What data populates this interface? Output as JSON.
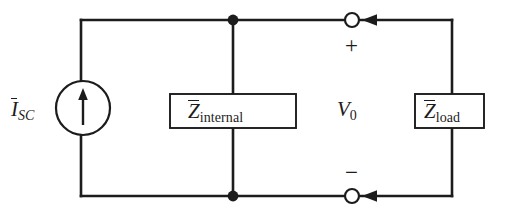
{
  "diagram": {
    "type": "electrical-schematic",
    "background_color": "#ffffff",
    "line_color": "#1c1c1c",
    "text_color": "#1c1c1c",
    "labels": {
      "current_source": {
        "symbol": "I",
        "subscript": "SC",
        "overbar": true,
        "full_text": "I̅SC"
      },
      "internal_impedance": {
        "symbol": "Z",
        "subscript": "internal",
        "overbar": true,
        "full_text": "Z̅internal"
      },
      "load_impedance": {
        "symbol": "Z",
        "subscript": "load",
        "overbar": true,
        "full_text": "Z̅load"
      },
      "output_voltage": {
        "symbol": "V",
        "subscript": "0",
        "overbar": false,
        "full_text": "V0"
      },
      "polarity_positive": "+",
      "polarity_negative": "−"
    },
    "components": [
      {
        "name": "current-source",
        "kind": "circle-with-up-arrow",
        "label": "I̅SC"
      },
      {
        "name": "internal-impedance-box",
        "kind": "rectangle",
        "label": "Z̅internal"
      },
      {
        "name": "load-impedance-box",
        "kind": "rectangle",
        "label": "Z̅load"
      },
      {
        "name": "output-terminal-top",
        "kind": "open-circle"
      },
      {
        "name": "output-terminal-bottom",
        "kind": "open-circle"
      },
      {
        "name": "junction-dot-top",
        "kind": "filled-dot"
      },
      {
        "name": "junction-dot-bottom",
        "kind": "filled-dot"
      },
      {
        "name": "current-arrow-top",
        "kind": "arrowhead-left"
      },
      {
        "name": "current-arrow-bottom",
        "kind": "arrowhead-left"
      }
    ]
  }
}
